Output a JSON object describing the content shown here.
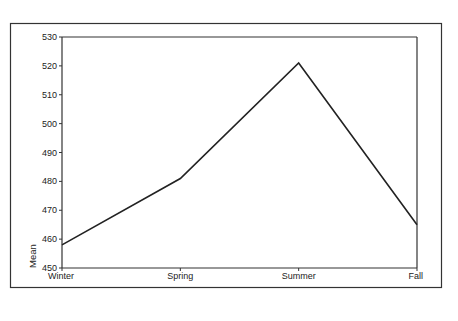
{
  "chart_data": {
    "type": "line",
    "title": "",
    "xlabel": "",
    "ylabel": "Mean",
    "categories": [
      "Winter",
      "Spring",
      "Summer",
      "Fall"
    ],
    "series": [
      {
        "name": "Mean",
        "values": [
          458,
          481,
          521,
          465
        ]
      }
    ],
    "ylim": [
      450,
      530
    ],
    "yticks": [
      450,
      460,
      470,
      480,
      490,
      500,
      510,
      520,
      530
    ],
    "grid": false,
    "legend": "none",
    "colors": {
      "line": "#222222",
      "axis": "#333333",
      "frame": "#333333",
      "background": "#ffffff"
    }
  }
}
